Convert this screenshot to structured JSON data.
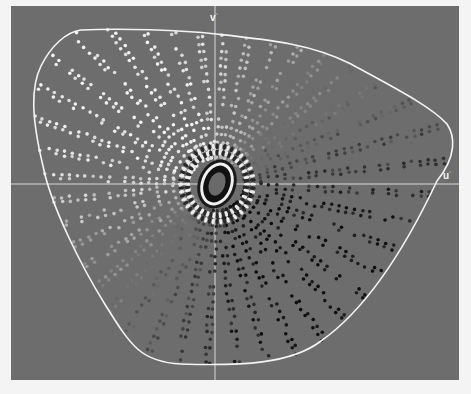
{
  "diagram": {
    "type": "chromaticity-scatter",
    "axes": {
      "u_label": "u",
      "v_label": "v",
      "label_suffix": "°",
      "origin_px": [
        204,
        178
      ]
    },
    "colors": {
      "background": "#6d6d6d",
      "axis_line": "#d9d9d9",
      "gamut_outline": "#f4f4f4",
      "page": "#f4f4f4"
    },
    "gamut_outline_path": "M 70 24 C 110 22, 170 24, 205 28 C 260 34, 300 38, 340 58 C 380 80, 420 100, 436 118 C 444 130, 446 150, 426 175 C 400 230, 360 300, 310 335 C 280 358, 230 360, 170 358 C 130 356, 120 340, 95 300 C 70 260, 40 200, 32 160 C 20 110, 20 80, 30 60 C 40 40, 55 26, 70 24 Z",
    "rays": {
      "count": 40,
      "inner_radius": 28,
      "outer_radius_max": 230,
      "dot_spacing": 8,
      "dot_radius": 1.8
    },
    "center_ellipse": {
      "cx": 206,
      "cy": 178,
      "rx": 13,
      "ry": 19,
      "rotation": 20
    }
  }
}
